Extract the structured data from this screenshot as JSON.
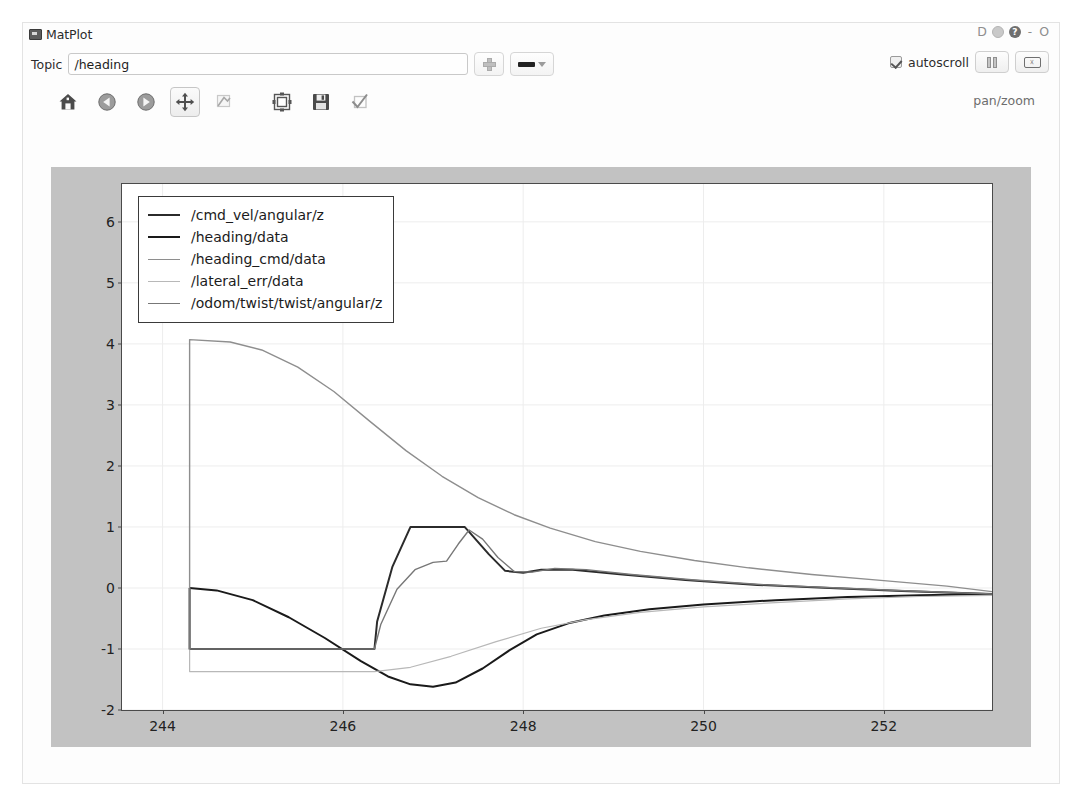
{
  "window": {
    "title": "MatPlot",
    "icon": "matplot-app-icon",
    "controls": [
      "D",
      "flower-icon",
      "help-icon",
      "-",
      "O"
    ]
  },
  "topic_bar": {
    "label": "Topic",
    "value": "/heading",
    "placeholder": "",
    "add_button": "plus-icon",
    "style_button": "line-style-dropdown",
    "autoscroll_label": "autoscroll",
    "autoscroll_checked": true,
    "pause_button": "pause-icon",
    "clear_button": "clear-icon"
  },
  "nav_toolbar": {
    "buttons": [
      {
        "name": "home",
        "icon": "home-icon",
        "active": false
      },
      {
        "name": "back",
        "icon": "back-arrow-icon",
        "active": false
      },
      {
        "name": "forward",
        "icon": "forward-arrow-icon",
        "active": false
      },
      {
        "name": "pan",
        "icon": "pan-move-icon",
        "active": true
      },
      {
        "name": "zoom",
        "icon": "zoom-rect-icon",
        "active": false
      },
      {
        "name": "subplots",
        "icon": "subplot-config-icon",
        "active": false
      },
      {
        "name": "save",
        "icon": "save-floppy-icon",
        "active": false
      },
      {
        "name": "toggle",
        "icon": "check-tick-icon",
        "active": false
      }
    ],
    "mode_text": "pan/zoom"
  },
  "chart_data": {
    "type": "line",
    "title": "",
    "xlabel": "",
    "ylabel": "",
    "xlim": [
      243.55,
      253.2
    ],
    "ylim": [
      -2.0,
      6.62
    ],
    "xticks": [
      244,
      246,
      248,
      250,
      252
    ],
    "yticks": [
      -2,
      -1,
      0,
      1,
      2,
      3,
      4,
      5,
      6
    ],
    "grid": true,
    "legend_position": "upper left",
    "colors": {
      "cmd_vel": "#2b2b2b",
      "heading": "#1a1a1a",
      "heading_cmd": "#8e8e8e",
      "lateral_err": "#b8b8b8",
      "odom": "#777777"
    },
    "series": [
      {
        "name": "/cmd_vel/angular/z",
        "color": "#2b2b2b",
        "points": [
          [
            244.3,
            0.0
          ],
          [
            244.3,
            -1.0
          ],
          [
            246.35,
            -1.0
          ],
          [
            246.38,
            -0.55
          ],
          [
            246.55,
            0.35
          ],
          [
            246.75,
            1.0
          ],
          [
            247.35,
            1.0
          ],
          [
            247.4,
            0.92
          ],
          [
            247.62,
            0.55
          ],
          [
            247.8,
            0.28
          ],
          [
            248.0,
            0.25
          ],
          [
            248.2,
            0.3
          ],
          [
            248.55,
            0.3
          ],
          [
            249.1,
            0.22
          ],
          [
            249.8,
            0.13
          ],
          [
            250.6,
            0.05
          ],
          [
            251.4,
            0.0
          ],
          [
            252.2,
            -0.05
          ],
          [
            253.2,
            -0.1
          ]
        ]
      },
      {
        "name": "/heading/data",
        "color": "#1a1a1a",
        "points": [
          [
            244.3,
            0.0
          ],
          [
            244.6,
            -0.04
          ],
          [
            245.0,
            -0.2
          ],
          [
            245.4,
            -0.48
          ],
          [
            245.8,
            -0.82
          ],
          [
            246.2,
            -1.2
          ],
          [
            246.5,
            -1.45
          ],
          [
            246.75,
            -1.58
          ],
          [
            247.0,
            -1.62
          ],
          [
            247.25,
            -1.55
          ],
          [
            247.55,
            -1.32
          ],
          [
            247.85,
            -1.02
          ],
          [
            248.15,
            -0.76
          ],
          [
            248.5,
            -0.58
          ],
          [
            248.9,
            -0.45
          ],
          [
            249.4,
            -0.35
          ],
          [
            250.0,
            -0.27
          ],
          [
            250.8,
            -0.2
          ],
          [
            251.6,
            -0.15
          ],
          [
            252.4,
            -0.12
          ],
          [
            253.2,
            -0.1
          ]
        ]
      },
      {
        "name": "/heading_cmd/data",
        "color": "#8e8e8e",
        "points": [
          [
            244.3,
            0.0
          ],
          [
            244.3,
            4.07
          ],
          [
            244.75,
            4.03
          ],
          [
            245.1,
            3.9
          ],
          [
            245.5,
            3.62
          ],
          [
            245.9,
            3.22
          ],
          [
            246.3,
            2.73
          ],
          [
            246.7,
            2.25
          ],
          [
            247.1,
            1.83
          ],
          [
            247.5,
            1.48
          ],
          [
            247.9,
            1.2
          ],
          [
            248.3,
            0.98
          ],
          [
            248.8,
            0.76
          ],
          [
            249.3,
            0.6
          ],
          [
            249.9,
            0.45
          ],
          [
            250.5,
            0.33
          ],
          [
            251.2,
            0.22
          ],
          [
            252.0,
            0.12
          ],
          [
            252.7,
            0.03
          ],
          [
            253.2,
            -0.06
          ]
        ]
      },
      {
        "name": "/lateral_err/data",
        "color": "#b8b8b8",
        "points": [
          [
            244.3,
            0.0
          ],
          [
            244.3,
            -1.37
          ],
          [
            246.35,
            -1.37
          ],
          [
            246.75,
            -1.3
          ],
          [
            247.2,
            -1.12
          ],
          [
            247.7,
            -0.88
          ],
          [
            248.2,
            -0.66
          ],
          [
            248.7,
            -0.52
          ],
          [
            249.3,
            -0.4
          ],
          [
            250.0,
            -0.31
          ],
          [
            250.8,
            -0.24
          ],
          [
            251.6,
            -0.18
          ],
          [
            252.4,
            -0.14
          ],
          [
            253.2,
            -0.12
          ]
        ]
      },
      {
        "name": "/odom/twist/twist/angular/z",
        "color": "#777777",
        "points": [
          [
            244.3,
            0.0
          ],
          [
            244.3,
            -1.0
          ],
          [
            245.6,
            -1.0
          ],
          [
            246.35,
            -1.0
          ],
          [
            246.42,
            -0.6
          ],
          [
            246.6,
            -0.02
          ],
          [
            246.8,
            0.3
          ],
          [
            247.0,
            0.42
          ],
          [
            247.15,
            0.44
          ],
          [
            247.28,
            0.72
          ],
          [
            247.4,
            0.95
          ],
          [
            247.55,
            0.8
          ],
          [
            247.72,
            0.5
          ],
          [
            247.9,
            0.27
          ],
          [
            248.1,
            0.26
          ],
          [
            248.35,
            0.32
          ],
          [
            248.7,
            0.3
          ],
          [
            249.2,
            0.22
          ],
          [
            249.9,
            0.13
          ],
          [
            250.7,
            0.05
          ],
          [
            251.5,
            0.0
          ],
          [
            252.3,
            -0.05
          ],
          [
            253.2,
            -0.1
          ]
        ]
      }
    ],
    "legend": [
      {
        "label": "/cmd_vel/angular/z",
        "color": "#2b2b2b",
        "width": 2.0
      },
      {
        "label": "/heading/data",
        "color": "#1a1a1a",
        "width": 2.0
      },
      {
        "label": "/heading_cmd/data",
        "color": "#8e8e8e",
        "width": 1.4
      },
      {
        "label": "/lateral_err/data",
        "color": "#b8b8b8",
        "width": 1.2
      },
      {
        "label": "/odom/twist/twist/angular/z",
        "color": "#777777",
        "width": 1.4
      }
    ]
  }
}
